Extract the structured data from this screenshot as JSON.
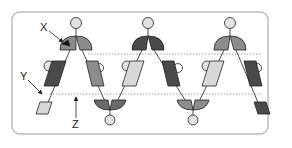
{
  "diagram": {
    "labels": {
      "x": "X",
      "y": "Y",
      "z": "Z"
    },
    "colors": {
      "frame": "#bdbdbd",
      "dotted_line": "#888888",
      "dark": "#4a4a4a",
      "medium": "#8c8c8c",
      "light": "#d8d8d8",
      "circle": "#e2e2e2",
      "stroke": "#222222"
    },
    "top_caps": [
      {
        "cx": 76,
        "left": "medium",
        "right": "medium"
      },
      {
        "cx": 148,
        "left": "dark",
        "right": "dark"
      },
      {
        "cx": 230,
        "left": "medium",
        "right": "medium"
      }
    ],
    "bottom_cups": [
      {
        "cx": 110,
        "left": "dark",
        "right": "dark"
      },
      {
        "cx": 193,
        "left": "medium",
        "right": "medium"
      }
    ],
    "segments": [
      {
        "id": "s1",
        "fill": "dark"
      },
      {
        "id": "s2",
        "fill": "medium"
      },
      {
        "id": "s3",
        "fill": "light"
      },
      {
        "id": "s4",
        "fill": "dark"
      },
      {
        "id": "s5",
        "fill": "light"
      },
      {
        "id": "s6",
        "fill": "dark"
      },
      {
        "id": "s7",
        "fill": "light"
      },
      {
        "id": "s8",
        "fill": "dark"
      }
    ]
  }
}
